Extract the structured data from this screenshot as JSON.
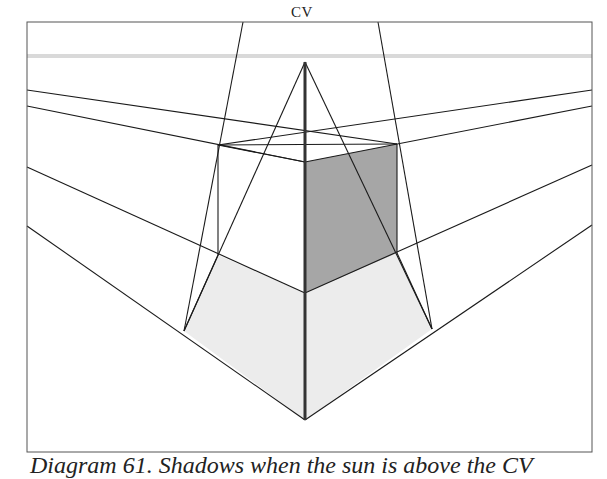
{
  "diagram": {
    "label_cv": "CV",
    "caption": "Diagram 61. Shadows when the sun is above the CV",
    "colors": {
      "frame": "#555555",
      "line": "#1a1a1a",
      "horizon": "#d9d9d9",
      "shaded_face": "#a6a6a6",
      "shadow": "#ececec"
    },
    "elements": [
      "frame",
      "horizon-line",
      "vanishing-lines",
      "cube",
      "shaded-face",
      "cast-shadow",
      "center-vertical-line"
    ]
  }
}
